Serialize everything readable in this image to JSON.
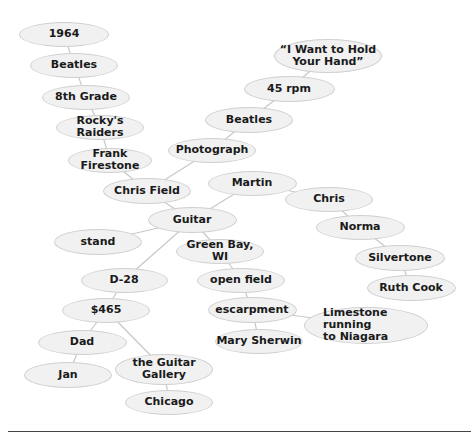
{
  "diagram": {
    "type": "cluster-map",
    "nodes": [
      {
        "id": "n1964",
        "label": "1964",
        "cx": 64,
        "cy": 34,
        "w": 90,
        "h": 25
      },
      {
        "id": "beatles1",
        "label": "Beatles",
        "cx": 74,
        "cy": 65,
        "w": 88,
        "h": 25
      },
      {
        "id": "grade8",
        "label": "8th Grade",
        "cx": 86,
        "cy": 97,
        "w": 88,
        "h": 25
      },
      {
        "id": "rockys",
        "label": "Rocky's Raiders",
        "cx": 100,
        "cy": 127,
        "w": 88,
        "h": 25
      },
      {
        "id": "frank",
        "label": "Frank Firestone",
        "cx": 110,
        "cy": 160,
        "w": 84,
        "h": 25
      },
      {
        "id": "chrisfield",
        "label": "Chris Field",
        "cx": 147,
        "cy": 191,
        "w": 88,
        "h": 26
      },
      {
        "id": "photograph",
        "label": "Photograph",
        "cx": 212,
        "cy": 150,
        "w": 88,
        "h": 25
      },
      {
        "id": "beatles2",
        "label": "Beatles",
        "cx": 249,
        "cy": 120,
        "w": 88,
        "h": 26
      },
      {
        "id": "rpm45",
        "label": "45 rpm",
        "cx": 289,
        "cy": 89,
        "w": 91,
        "h": 26
      },
      {
        "id": "iwant",
        "label": "“I Want to Hold\nYour Hand”",
        "cx": 328,
        "cy": 56,
        "w": 108,
        "h": 34
      },
      {
        "id": "guitar",
        "label": "Guitar",
        "cx": 192,
        "cy": 220,
        "w": 89,
        "h": 26
      },
      {
        "id": "martin",
        "label": "Martin",
        "cx": 252,
        "cy": 183,
        "w": 89,
        "h": 25
      },
      {
        "id": "chris",
        "label": "Chris",
        "cx": 329,
        "cy": 199,
        "w": 88,
        "h": 25
      },
      {
        "id": "norma",
        "label": "Norma",
        "cx": 360,
        "cy": 227,
        "w": 89,
        "h": 25
      },
      {
        "id": "silvertone",
        "label": "Silvertone",
        "cx": 400,
        "cy": 258,
        "w": 90,
        "h": 26
      },
      {
        "id": "ruthcook",
        "label": "Ruth Cook",
        "cx": 411,
        "cy": 288,
        "w": 89,
        "h": 26
      },
      {
        "id": "stand",
        "label": "stand",
        "cx": 98,
        "cy": 242,
        "w": 88,
        "h": 26
      },
      {
        "id": "greenbay",
        "label": "Green Bay, WI",
        "cx": 220,
        "cy": 251,
        "w": 88,
        "h": 25
      },
      {
        "id": "openfield",
        "label": "open field",
        "cx": 241,
        "cy": 280,
        "w": 88,
        "h": 25
      },
      {
        "id": "escarpment",
        "label": "escarpment",
        "cx": 252,
        "cy": 310,
        "w": 89,
        "h": 26
      },
      {
        "id": "limestone",
        "label": "Limestone running\nto Niagara",
        "cx": 366,
        "cy": 325,
        "w": 124,
        "h": 37,
        "align": "left"
      },
      {
        "id": "marysherwin",
        "label": "Mary Sherwin",
        "cx": 259,
        "cy": 341,
        "w": 88,
        "h": 25
      },
      {
        "id": "d28",
        "label": "D-28",
        "cx": 124,
        "cy": 280,
        "w": 87,
        "h": 25
      },
      {
        "id": "dollar465",
        "label": "$465",
        "cx": 106,
        "cy": 310,
        "w": 88,
        "h": 25
      },
      {
        "id": "dad",
        "label": "Dad",
        "cx": 82,
        "cy": 342,
        "w": 89,
        "h": 25
      },
      {
        "id": "jan",
        "label": "Jan",
        "cx": 68,
        "cy": 375,
        "w": 88,
        "h": 26
      },
      {
        "id": "guitargallery",
        "label": "the Guitar Gallery",
        "cx": 164,
        "cy": 369,
        "w": 98,
        "h": 31
      },
      {
        "id": "chicago",
        "label": "Chicago",
        "cx": 169,
        "cy": 402,
        "w": 88,
        "h": 25
      }
    ],
    "edges": [
      [
        "n1964",
        "beatles1"
      ],
      [
        "beatles1",
        "grade8"
      ],
      [
        "grade8",
        "rockys"
      ],
      [
        "rockys",
        "frank"
      ],
      [
        "frank",
        "chrisfield"
      ],
      [
        "chrisfield",
        "photograph"
      ],
      [
        "photograph",
        "beatles2"
      ],
      [
        "beatles2",
        "rpm45"
      ],
      [
        "rpm45",
        "iwant"
      ],
      [
        "chrisfield",
        "guitar"
      ],
      [
        "guitar",
        "martin"
      ],
      [
        "martin",
        "chris"
      ],
      [
        "chris",
        "norma"
      ],
      [
        "norma",
        "silvertone"
      ],
      [
        "silvertone",
        "ruthcook"
      ],
      [
        "guitar",
        "stand"
      ],
      [
        "guitar",
        "greenbay"
      ],
      [
        "greenbay",
        "openfield"
      ],
      [
        "openfield",
        "escarpment"
      ],
      [
        "escarpment",
        "limestone"
      ],
      [
        "escarpment",
        "marysherwin"
      ],
      [
        "guitar",
        "d28"
      ],
      [
        "d28",
        "dollar465"
      ],
      [
        "dollar465",
        "dad"
      ],
      [
        "dad",
        "jan"
      ],
      [
        "dollar465",
        "guitargallery"
      ],
      [
        "guitargallery",
        "chicago"
      ]
    ],
    "colors": {
      "node_fill": "#f1f1f1",
      "node_border": "#cfcfcf",
      "edge": "#c8c8c8",
      "text": "#1a1a1a",
      "rule": "#444444"
    }
  }
}
